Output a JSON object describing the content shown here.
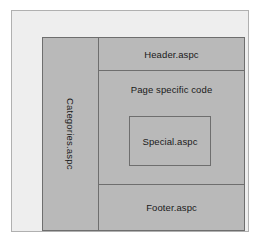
{
  "diagram": {
    "colors": {
      "page_background": "#ffffff",
      "outer_frame_fill": "#eeeeee",
      "outer_frame_border": "#b0b0b0",
      "container_fill": "#b9b9b9",
      "line_color": "#6e6e6e",
      "text_color": "#1a1a1a"
    },
    "regions": {
      "sidebar": {
        "label": "Categories.aspc",
        "orientation": "vertical-rotated"
      },
      "header": {
        "label": "Header.aspc"
      },
      "body": {
        "label": "Page specific code"
      },
      "special": {
        "label": "Special.aspc"
      },
      "footer": {
        "label": "Footer.aspc"
      }
    }
  }
}
